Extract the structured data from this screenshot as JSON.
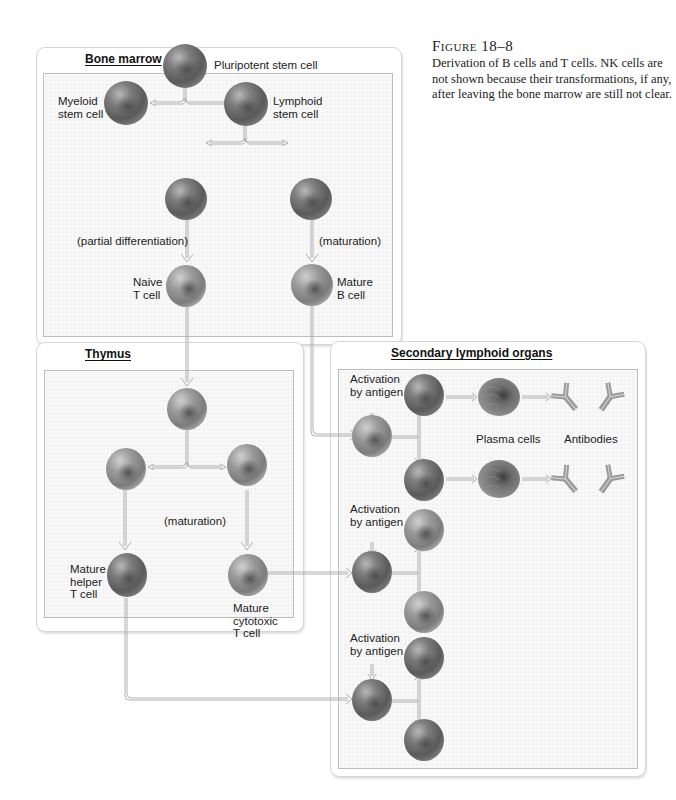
{
  "caption": {
    "figure_label": "Figure 18–8",
    "text": "Derivation of B cells and T cells. NK cells are not shown because their transformations, if any, after leaving the bone marrow are still not clear."
  },
  "panels": {
    "bone_marrow": {
      "title": "Bone marrow",
      "labels": {
        "pluripotent": "Pluripotent stem cell",
        "myeloid_1": "Myeloid",
        "myeloid_2": "stem cell",
        "lymphoid_1": "Lymphoid",
        "lymphoid_2": "stem cell",
        "partial_diff": "(partial differentiation)",
        "maturation": "(maturation)",
        "naive_1": "Naive",
        "naive_2": "T cell",
        "mature_b_1": "Mature",
        "mature_b_2": "B cell"
      }
    },
    "thymus": {
      "title": "Thymus",
      "labels": {
        "maturation": "(maturation)",
        "helper_1": "Mature",
        "helper_2": "helper",
        "helper_3": "T cell",
        "cyto_1": "Mature",
        "cyto_2": "cytotoxic",
        "cyto_3": "T cell"
      }
    },
    "secondary": {
      "title": "Secondary lymphoid organs",
      "labels": {
        "act1_1": "Activation",
        "act1_2": "by antigen",
        "act2_1": "Activation",
        "act2_2": "by antigen",
        "act3_1": "Activation",
        "act3_2": "by antigen",
        "plasma": "Plasma cells",
        "antibodies": "Antibodies"
      }
    }
  },
  "colors": {
    "cell_dark": "#5f5f5f",
    "cell_light": "#8a8a8a",
    "arrow": "#b0b0b0",
    "panel_fill": "#f3f3f3"
  }
}
